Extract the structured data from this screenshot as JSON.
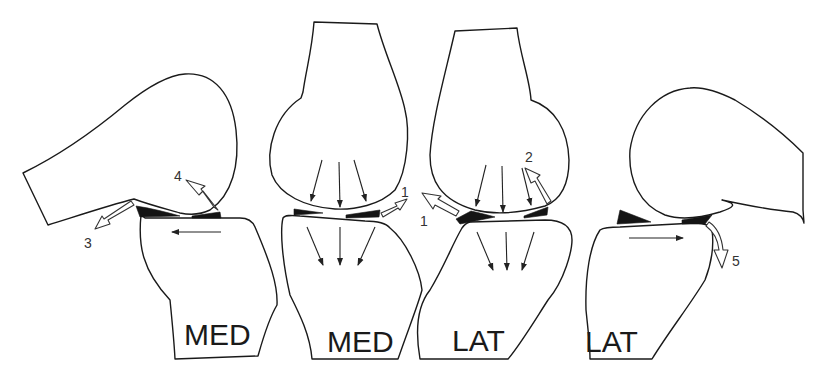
{
  "figure": {
    "panels": [
      {
        "id": "panel-1",
        "label": "MED",
        "view": "flexion, medial compartment",
        "callouts": [
          "3",
          "4"
        ]
      },
      {
        "id": "panel-2",
        "label": "MED",
        "view": "extension, medial compartment",
        "callouts": [
          "1"
        ]
      },
      {
        "id": "panel-3",
        "label": "LAT",
        "view": "extension, lateral compartment",
        "callouts": [
          "1",
          "2"
        ]
      },
      {
        "id": "panel-4",
        "label": "LAT",
        "view": "flexion, lateral compartment",
        "callouts": [
          "5"
        ]
      }
    ],
    "callout_numbers": {
      "n1a": "1",
      "n1b": "1",
      "n2": "2",
      "n3": "3",
      "n4": "4",
      "n5": "5"
    }
  },
  "colors": {
    "outline": "#1a1a1a",
    "meniscus": "#141414",
    "background": "#ffffff"
  }
}
